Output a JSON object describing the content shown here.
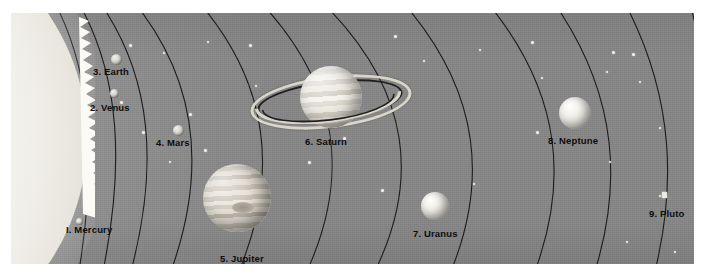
{
  "figure": {
    "background_color": "#8b8b8b",
    "orbit_line_color": "#1c1c1c",
    "label_color": "#0d0d0d",
    "margin_color": "#ffffff"
  },
  "sun": {
    "label": "Sun",
    "color": "#f6f4ef",
    "x": 14,
    "y": 128
  },
  "planets": [
    {
      "number": "I.",
      "name": "Mercury",
      "label": "I.  Mercury",
      "type": "rocky",
      "cx": 68,
      "cy": 208,
      "diameter": 7,
      "label_x": 55,
      "label_y": 216
    },
    {
      "number": "2.",
      "name": "Venus",
      "label": "2.  Venus",
      "type": "rocky",
      "cx": 103,
      "cy": 80,
      "diameter": 9,
      "label_x": 79,
      "label_y": 93
    },
    {
      "number": "3.",
      "name": "Earth",
      "label": "3.  Earth",
      "type": "rocky",
      "cx": 105,
      "cy": 46,
      "diameter": 11,
      "label_x": 82,
      "label_y": 57
    },
    {
      "number": "4.",
      "name": "Mars",
      "label": "4.  Mars",
      "type": "rocky",
      "cx": 167,
      "cy": 117,
      "diameter": 11,
      "label_x": 145,
      "label_y": 128
    },
    {
      "number": "5.",
      "name": "Jupiter",
      "label": "5.  Jupiter",
      "type": "gas-giant-banded",
      "cx": 237,
      "cy": 198,
      "diameter": 68,
      "label_x": 209,
      "label_y": 246
    },
    {
      "number": "6.",
      "name": "Saturn",
      "label": "6.  Saturn",
      "type": "ringed-gas-giant",
      "cx": 320,
      "cy": 85,
      "diameter": 62,
      "ring_width": 140,
      "ring_height": 42,
      "label_x": 294,
      "label_y": 128
    },
    {
      "number": "7.",
      "name": "Uranus",
      "label": "7.  Uranus",
      "type": "ice-giant",
      "cx": 424,
      "cy": 193,
      "diameter": 28,
      "label_x": 402,
      "label_y": 221
    },
    {
      "number": "8.",
      "name": "Neptune",
      "label": "8.  Neptune",
      "type": "ice-giant",
      "cx": 564,
      "cy": 100,
      "diameter": 32,
      "label_x": 537,
      "label_y": 129
    },
    {
      "number": "9.",
      "name": "Pluto",
      "label": "9.  Pluto",
      "type": "dwarf",
      "cx": 664,
      "cy": 195,
      "diameter": 5,
      "label_x": 650,
      "label_y": 208
    }
  ],
  "orbit_count": 9,
  "star_count": 28
}
